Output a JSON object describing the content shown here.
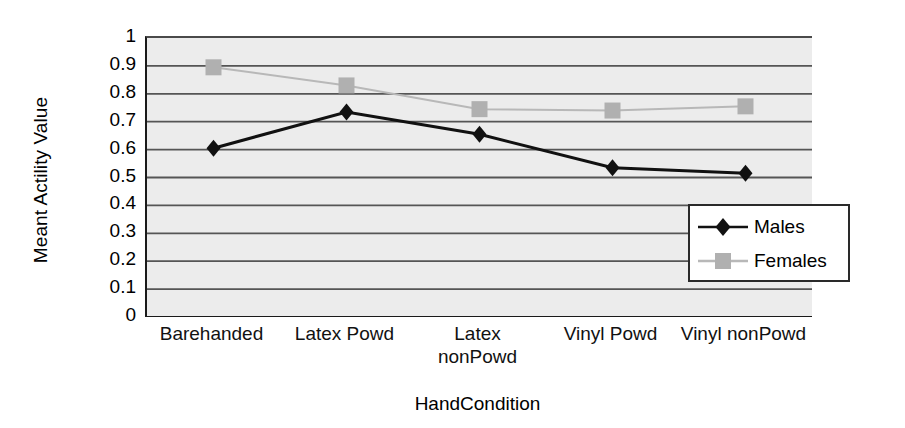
{
  "chart_data": {
    "type": "line",
    "title": "",
    "xlabel": "HandCondition",
    "ylabel": "Meant Actility Value",
    "categories": [
      "Barehanded",
      "Latex Powd",
      "Latex nonPowd",
      "Vinyl Powd",
      "Vinyl nonPowd"
    ],
    "category_lines": [
      [
        "Barehanded"
      ],
      [
        "Latex Powd"
      ],
      [
        "Latex",
        "nonPowd"
      ],
      [
        "Vinyl Powd"
      ],
      [
        "Vinyl nonPowd"
      ]
    ],
    "series": [
      {
        "name": "Males",
        "marker": "diamond",
        "color": "#111111",
        "line_color": "#111111",
        "values": [
          0.605,
          0.735,
          0.655,
          0.535,
          0.515
        ]
      },
      {
        "name": "Females",
        "marker": "square",
        "color": "#b0b0b0",
        "line_color": "#b8b8b8",
        "values": [
          0.895,
          0.83,
          0.745,
          0.74,
          0.755
        ]
      }
    ],
    "ylim": [
      0,
      1
    ],
    "ytick_values": [
      "1",
      "0.9",
      "0.8",
      "0.7",
      "0.6",
      "0.5",
      "0.4",
      "0.3",
      "0.2",
      "0.1",
      "0"
    ],
    "grid": "horizontal",
    "legend_position": "inside-right",
    "plot_background": "#ececec",
    "page_background": "#ffffff",
    "axis_color": "#1a1a1a",
    "gridline_color": "#555555"
  },
  "legend": {
    "entries": [
      {
        "label": "Males"
      },
      {
        "label": "Females"
      }
    ]
  }
}
